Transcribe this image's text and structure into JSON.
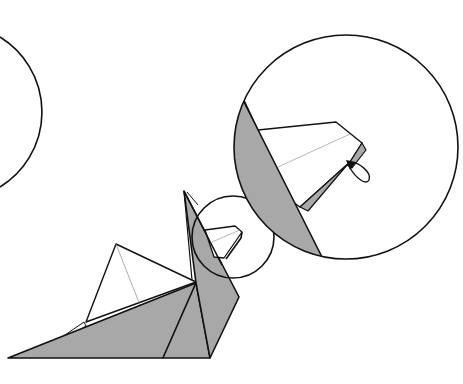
{
  "diagram": {
    "type": "origami-instruction-step",
    "colors": {
      "background": "#ffffff",
      "outline": "#111111",
      "paper_colored_side": "#a8a8a8",
      "paper_white_side": "#ffffff",
      "crease_line": "#888888"
    },
    "elements": [
      {
        "id": "previous-step-circle",
        "kind": "partial-circle",
        "note": "cropped magnifier from previous step at left edge"
      },
      {
        "id": "bird-model",
        "kind": "folded-paper-figure"
      },
      {
        "id": "detail-source-circle",
        "kind": "circle",
        "note": "marks head area on model"
      },
      {
        "id": "magnified-detail-circle",
        "kind": "circle",
        "note": "enlarged view of head with beak fold"
      },
      {
        "id": "fold-arrow-loop",
        "kind": "arrow",
        "note": "loop indicating tucking/folding the beak tip"
      }
    ]
  }
}
